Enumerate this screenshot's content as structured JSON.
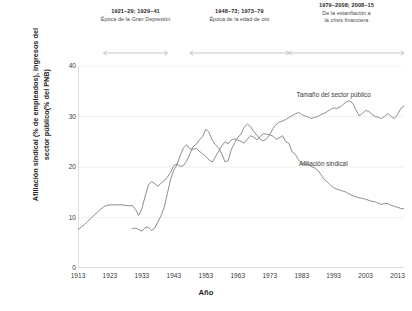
{
  "chart_data": {
    "type": "line",
    "title": "",
    "xlabel": "Año",
    "ylabel": "Afiliación sindical (% de empleados), ingresos del sector público(% del PNB)",
    "ylabel_line1": "Afiliación sindical (% de empleados), ingresos del",
    "ylabel_line2": "sector público(% del PNB)",
    "xlim": [
      1913,
      2015
    ],
    "ylim": [
      0,
      40
    ],
    "yticks": [
      0,
      10,
      20,
      30,
      40
    ],
    "xticks": [
      1913,
      1923,
      1933,
      1943,
      1953,
      1963,
      1973,
      1983,
      1993,
      2003,
      2013
    ],
    "grid": "horizontal-faint",
    "legend_position": "inline-annotations",
    "line_color": "#7a7a7a",
    "series": [
      {
        "name": "Afiliación sindical",
        "label_x_year": 1989,
        "label_y_value": 20.3,
        "x": [
          1913,
          1914,
          1915,
          1916,
          1917,
          1918,
          1919,
          1920,
          1921,
          1922,
          1923,
          1924,
          1925,
          1926,
          1927,
          1928,
          1929,
          1930,
          1931,
          1932,
          1933,
          1934,
          1935,
          1936,
          1937,
          1938,
          1939,
          1940,
          1941,
          1942,
          1943,
          1944,
          1945,
          1946,
          1947,
          1948,
          1949,
          1950,
          1951,
          1952,
          1953,
          1954,
          1955,
          1956,
          1957,
          1958,
          1959,
          1960,
          1961,
          1962,
          1963,
          1964,
          1965,
          1966,
          1967,
          1968,
          1969,
          1970,
          1971,
          1972,
          1973,
          1974,
          1975,
          1976,
          1977,
          1978,
          1979,
          1980,
          1981,
          1982,
          1983,
          1984,
          1985,
          1986,
          1987,
          1988,
          1989,
          1990,
          1991,
          1992,
          1993,
          1994,
          1995,
          1996,
          1997,
          1998,
          1999,
          2000,
          2001,
          2002,
          2003,
          2004,
          2005,
          2006,
          2007,
          2008,
          2009,
          2010,
          2011,
          2012,
          2013,
          2014,
          2015
        ],
        "y": [
          7.6,
          8.1,
          8.6,
          9.2,
          9.8,
          10.4,
          11.0,
          11.6,
          12.1,
          12.4,
          12.5,
          12.5,
          12.5,
          12.5,
          12.5,
          12.4,
          12.3,
          12.4,
          11.6,
          10.4,
          11.8,
          14.2,
          16.4,
          17.1,
          16.7,
          16.2,
          16.8,
          17.3,
          18.0,
          19.0,
          20.3,
          20.6,
          20.1,
          20.3,
          21.2,
          22.6,
          24.0,
          24.5,
          25.4,
          26.0,
          27.5,
          26.9,
          25.3,
          24.4,
          23.8,
          22.6,
          21.0,
          21.3,
          23.5,
          24.8,
          25.9,
          26.5,
          27.9,
          28.5,
          28.0,
          27.0,
          26.3,
          25.5,
          25.2,
          25.6,
          26.4,
          26.1,
          25.5,
          25.8,
          26.2,
          25.0,
          24.7,
          23.0,
          22.5,
          21.4,
          20.7,
          20.5,
          20.6,
          20.1,
          19.8,
          19.4,
          18.5,
          17.6,
          17.0,
          16.4,
          15.9,
          15.6,
          15.4,
          15.2,
          15.0,
          14.6,
          14.3,
          14.1,
          13.9,
          13.8,
          13.6,
          13.4,
          13.2,
          13.1,
          12.8,
          12.6,
          12.8,
          12.7,
          12.4,
          12.2,
          12.0,
          11.8,
          11.7
        ]
      },
      {
        "name": "Tamaño del sector público",
        "label_x_year": 1992,
        "label_y_value": 34.0,
        "x": [
          1930,
          1931,
          1932,
          1933,
          1934,
          1935,
          1936,
          1937,
          1938,
          1939,
          1940,
          1941,
          1942,
          1943,
          1944,
          1945,
          1946,
          1947,
          1948,
          1949,
          1950,
          1951,
          1952,
          1953,
          1954,
          1955,
          1956,
          1957,
          1958,
          1959,
          1960,
          1961,
          1962,
          1963,
          1964,
          1965,
          1966,
          1967,
          1968,
          1969,
          1970,
          1971,
          1972,
          1973,
          1974,
          1975,
          1976,
          1977,
          1978,
          1979,
          1980,
          1981,
          1982,
          1983,
          1984,
          1985,
          1986,
          1987,
          1988,
          1989,
          1990,
          1991,
          1992,
          1993,
          1994,
          1995,
          1996,
          1997,
          1998,
          1999,
          2000,
          2001,
          2002,
          2003,
          2004,
          2005,
          2006,
          2007,
          2008,
          2009,
          2010,
          2011,
          2012,
          2013,
          2014,
          2015
        ],
        "y": [
          7.8,
          7.9,
          7.6,
          7.3,
          8.0,
          8.1,
          7.4,
          7.9,
          9.1,
          10.4,
          12.1,
          14.9,
          17.6,
          19.4,
          20.5,
          22.3,
          23.8,
          24.4,
          23.6,
          23.5,
          23.7,
          23.1,
          22.6,
          22.1,
          21.4,
          21.0,
          22.0,
          23.1,
          24.2,
          25.0,
          24.6,
          25.4,
          25.6,
          25.3,
          25.1,
          24.7,
          25.5,
          26.2,
          25.9,
          25.4,
          26.0,
          26.6,
          26.5,
          26.4,
          27.6,
          28.4,
          28.9,
          29.1,
          29.4,
          29.8,
          30.2,
          30.5,
          30.8,
          30.4,
          30.1,
          29.9,
          29.6,
          29.8,
          30.0,
          30.4,
          30.6,
          31.0,
          31.4,
          31.7,
          31.6,
          31.9,
          32.4,
          32.9,
          33.1,
          32.6,
          31.3,
          30.1,
          30.6,
          31.2,
          31.0,
          30.4,
          30.0,
          29.8,
          29.6,
          30.1,
          30.6,
          30.0,
          29.6,
          30.4,
          31.6,
          32.1
        ]
      }
    ],
    "eras": [
      {
        "range": "1921–29; 1929–41",
        "desc_line1": "Época de la Gran Depresión",
        "desc_line2": "",
        "start_year": 1921,
        "end_year": 1941
      },
      {
        "range": "1948–73; 1973–79",
        "desc_line1": "Época de la edad de oro",
        "desc_line2": "",
        "start_year": 1948,
        "end_year": 1979
      },
      {
        "range": "1979–2008; 2008–15",
        "desc_line1": "De la estanflación a",
        "desc_line2": "la crisis financiera",
        "start_year": 1979,
        "end_year": 2015
      }
    ]
  }
}
